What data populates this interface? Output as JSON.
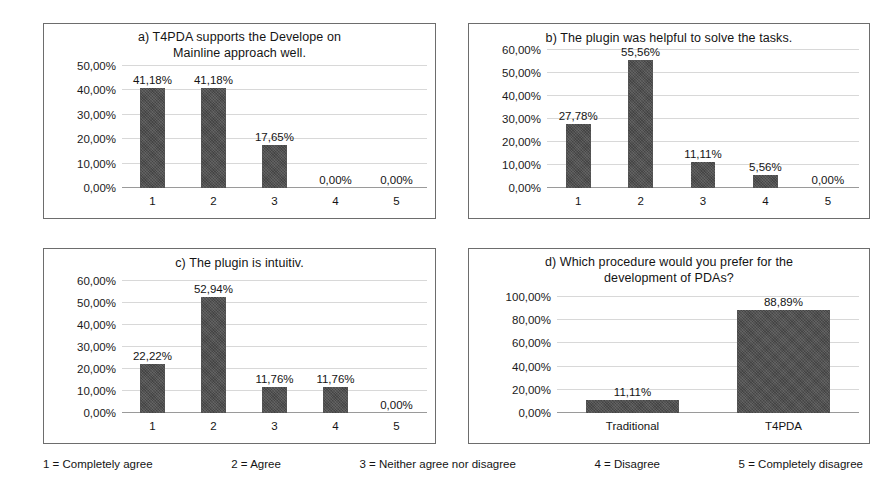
{
  "figure": {
    "background": "#ffffff",
    "bar_color": "#4d4d4d",
    "grid_color": "#d8d8d8",
    "axis_color": "#9a9a9a"
  },
  "legend": {
    "items": [
      "1 = Completely agree",
      "2 = Agree",
      "3 = Neither agree nor disagree",
      "4 = Disagree",
      "5 = Completely disagree"
    ]
  },
  "chart_data": [
    {
      "id": "a",
      "type": "bar",
      "title": "a) T4PDA supports the Develope on Mainline approach well.",
      "title_lines": [
        "a) T4PDA supports the Develope on",
        "Mainline approach well."
      ],
      "categories": [
        "1",
        "2",
        "3",
        "4",
        "5"
      ],
      "values": [
        41.18,
        41.18,
        17.65,
        0.0,
        0.0
      ],
      "labels": [
        "41,18%",
        "41,18%",
        "17,65%",
        "0,00%",
        "0,00%"
      ],
      "yticks": [
        0,
        10,
        20,
        30,
        40,
        50
      ],
      "ytick_labels": [
        "0,00%",
        "10,00%",
        "20,00%",
        "30,00%",
        "40,00%",
        "50,00%"
      ],
      "ylim": [
        0,
        50
      ],
      "xlabel": "",
      "ylabel": "",
      "grid": true,
      "legend_position": "none"
    },
    {
      "id": "b",
      "type": "bar",
      "title": "b) The plugin was helpful to solve the tasks.",
      "title_lines": [
        "b) The plugin was helpful to solve the tasks."
      ],
      "categories": [
        "1",
        "2",
        "3",
        "4",
        "5"
      ],
      "values": [
        27.78,
        55.56,
        11.11,
        5.56,
        0.0
      ],
      "labels": [
        "27,78%",
        "55,56%",
        "11,11%",
        "5,56%",
        "0,00%"
      ],
      "yticks": [
        0,
        10,
        20,
        30,
        40,
        50,
        60
      ],
      "ytick_labels": [
        "0,00%",
        "10,00%",
        "20,00%",
        "30,00%",
        "40,00%",
        "50,00%",
        "60,00%"
      ],
      "ylim": [
        0,
        60
      ],
      "xlabel": "",
      "ylabel": "",
      "grid": true,
      "legend_position": "none"
    },
    {
      "id": "c",
      "type": "bar",
      "title": "c) The plugin is intuitiv.",
      "title_lines": [
        "c) The plugin is intuitiv."
      ],
      "categories": [
        "1",
        "2",
        "3",
        "4",
        "5"
      ],
      "values": [
        22.22,
        52.94,
        11.76,
        11.76,
        0.0
      ],
      "labels": [
        "22,22%",
        "52,94%",
        "11,76%",
        "11,76%",
        "0,00%"
      ],
      "yticks": [
        0,
        10,
        20,
        30,
        40,
        50,
        60
      ],
      "ytick_labels": [
        "0,00%",
        "10,00%",
        "20,00%",
        "30,00%",
        "40,00%",
        "50,00%",
        "60,00%"
      ],
      "ylim": [
        0,
        60
      ],
      "xlabel": "",
      "ylabel": "",
      "grid": true,
      "legend_position": "none"
    },
    {
      "id": "d",
      "type": "bar",
      "title": "d) Which procedure would you prefer for the development of PDAs?",
      "title_lines": [
        "d) Which procedure would you prefer for the",
        "development of PDAs?"
      ],
      "categories": [
        "Traditional",
        "T4PDA"
      ],
      "values": [
        11.11,
        88.89
      ],
      "labels": [
        "11,11%",
        "88,89%"
      ],
      "yticks": [
        0,
        20,
        40,
        60,
        80,
        100
      ],
      "ytick_labels": [
        "0,00%",
        "20,00%",
        "40,00%",
        "60,00%",
        "80,00%",
        "100,00%"
      ],
      "ylim": [
        0,
        100
      ],
      "xlabel": "",
      "ylabel": "",
      "grid": true,
      "legend_position": "none"
    }
  ]
}
